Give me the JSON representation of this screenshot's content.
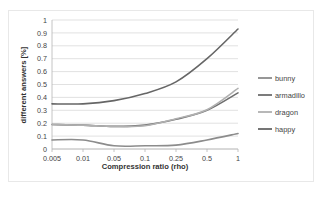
{
  "chart_data": {
    "type": "line",
    "title": "",
    "xlabel": "Compression ratio (rho)",
    "ylabel": "different answers [%]",
    "categories": [
      "0.005",
      "0.01",
      "0.05",
      "0.1",
      "0.25",
      "0.5",
      "1"
    ],
    "xticklabels": [
      "0.005",
      "0.01",
      "0.05",
      "0.1",
      "0.25",
      "0.5",
      "1"
    ],
    "yticklabels": [
      "0",
      "0.1",
      "0.2",
      "0.3",
      "0.4",
      "0.5",
      "0.6",
      "0.7",
      "0.8",
      "0.9",
      "1"
    ],
    "ylim": [
      0,
      1
    ],
    "ytick_step": 0.1,
    "grid": "horizontal",
    "legend_position": "right",
    "series": [
      {
        "name": "bunny",
        "color": "#8c8c8c",
        "values": [
          0.07,
          0.07,
          0.025,
          0.025,
          0.03,
          0.07,
          0.12
        ]
      },
      {
        "name": "armadillo",
        "color": "#6e6e6e",
        "values": [
          0.19,
          0.185,
          0.175,
          0.185,
          0.23,
          0.3,
          0.435
        ]
      },
      {
        "name": "dragon",
        "color": "#b0b0b0",
        "values": [
          0.19,
          0.185,
          0.175,
          0.18,
          0.235,
          0.305,
          0.47
        ]
      },
      {
        "name": "happy",
        "color": "#666666",
        "values": [
          0.35,
          0.35,
          0.375,
          0.43,
          0.52,
          0.7,
          0.93
        ]
      }
    ]
  },
  "legend": {
    "entries": [
      {
        "label": "bunny"
      },
      {
        "label": "armadillo"
      },
      {
        "label": "dragon"
      },
      {
        "label": "happy"
      }
    ]
  },
  "axes": {
    "x_title": "Compression ratio (rho)",
    "y_title": "different answers [%]"
  },
  "colors": {
    "gridline": "#d9d9d9",
    "axis": "#b5b5b5",
    "tick_label": "#444444",
    "axis_title": "#333333",
    "plot_background": "#ffffff",
    "figure_border": "#e8e8e8"
  }
}
